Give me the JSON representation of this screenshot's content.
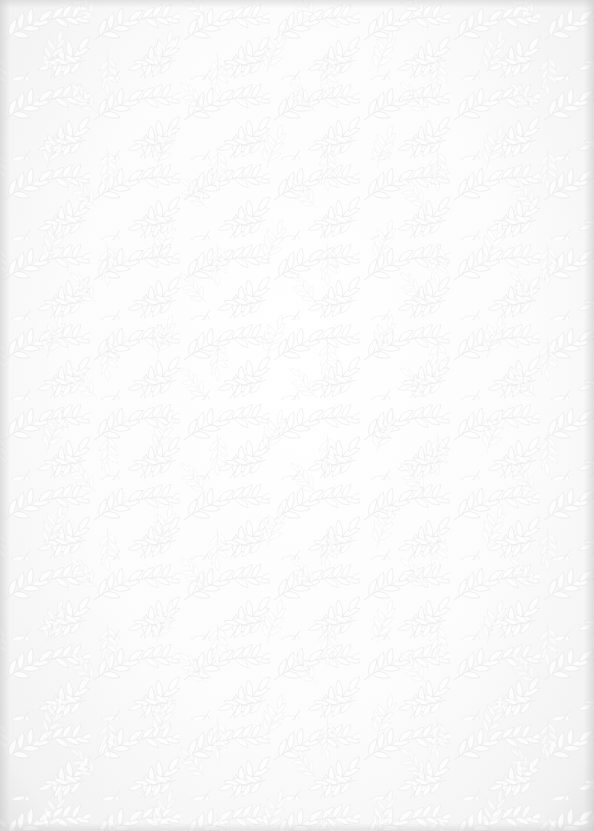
{
  "image": {
    "description": "White embossed paper with leaf and vine pattern",
    "pattern": "leaf-vine",
    "colors": {
      "base": "#fbfbfb",
      "leaf_highlight": "#ffffff",
      "leaf_shadow": "#e8e8e8",
      "edge_shadow": "#d6d6d6"
    }
  }
}
